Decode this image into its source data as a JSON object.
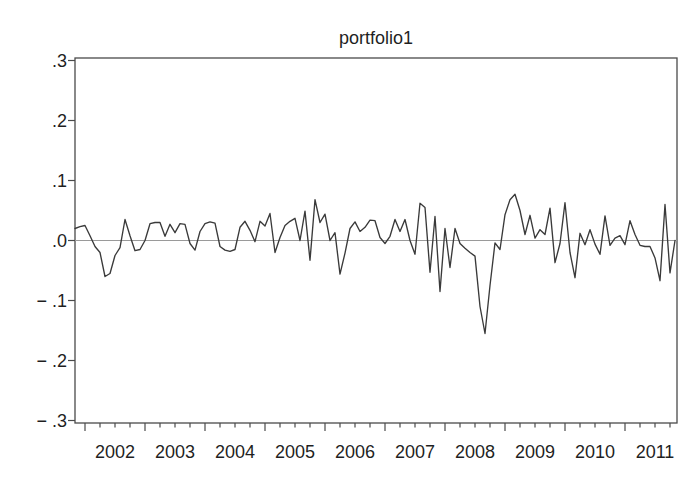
{
  "chart_data": {
    "type": "line",
    "title": "portfolio1",
    "series_name": "portfolio1",
    "frequency": "monthly",
    "start_period": "2001M11",
    "end_period": "2011M11",
    "xlabel": "",
    "ylabel": "",
    "ylim": [
      -0.3,
      0.3
    ],
    "grid": false,
    "zero_line": true,
    "legend_position": "none",
    "line_color": "#3a3a3a",
    "y_ticks": [
      0.3,
      0.2,
      0.1,
      0.0,
      -0.1,
      -0.2,
      -0.3
    ],
    "y_tick_labels": [
      ".3",
      ".2",
      ".1",
      ".0",
      "− .1",
      "− .2",
      "− .3"
    ],
    "x_year_labels": [
      "2002",
      "2003",
      "2004",
      "2005",
      "2006",
      "2007",
      "2008",
      "2009",
      "2010",
      "2011"
    ],
    "values": [
      0.02,
      0.023,
      0.025,
      0.008,
      -0.01,
      -0.02,
      -0.06,
      -0.055,
      -0.025,
      -0.012,
      0.035,
      0.008,
      -0.017,
      -0.015,
      0.0,
      0.028,
      0.03,
      0.03,
      0.007,
      0.027,
      0.013,
      0.028,
      0.027,
      -0.005,
      -0.016,
      0.015,
      0.028,
      0.031,
      0.029,
      -0.01,
      -0.016,
      -0.018,
      -0.015,
      0.022,
      0.032,
      0.017,
      -0.002,
      0.032,
      0.024,
      0.045,
      -0.02,
      0.005,
      0.025,
      0.032,
      0.037,
      0.0,
      0.049,
      -0.033,
      0.068,
      0.03,
      0.044,
      0.0,
      0.013,
      -0.056,
      -0.021,
      0.02,
      0.031,
      0.015,
      0.022,
      0.034,
      0.033,
      0.005,
      -0.005,
      0.007,
      0.035,
      0.015,
      0.035,
      0.0,
      -0.023,
      0.062,
      0.055,
      -0.053,
      0.04,
      -0.085,
      0.02,
      -0.045,
      0.02,
      -0.005,
      -0.013,
      -0.02,
      -0.026,
      -0.11,
      -0.155,
      -0.075,
      -0.004,
      -0.015,
      0.043,
      0.068,
      0.077,
      0.05,
      0.01,
      0.042,
      0.004,
      0.018,
      0.01,
      0.054,
      -0.037,
      -0.005,
      0.063,
      -0.02,
      -0.062,
      0.012,
      -0.007,
      0.018,
      -0.006,
      -0.023,
      0.041,
      -0.008,
      0.004,
      0.008,
      -0.007,
      0.033,
      0.01,
      -0.008,
      -0.01,
      -0.01,
      -0.029,
      -0.067,
      0.06,
      -0.054,
      0.0
    ]
  }
}
